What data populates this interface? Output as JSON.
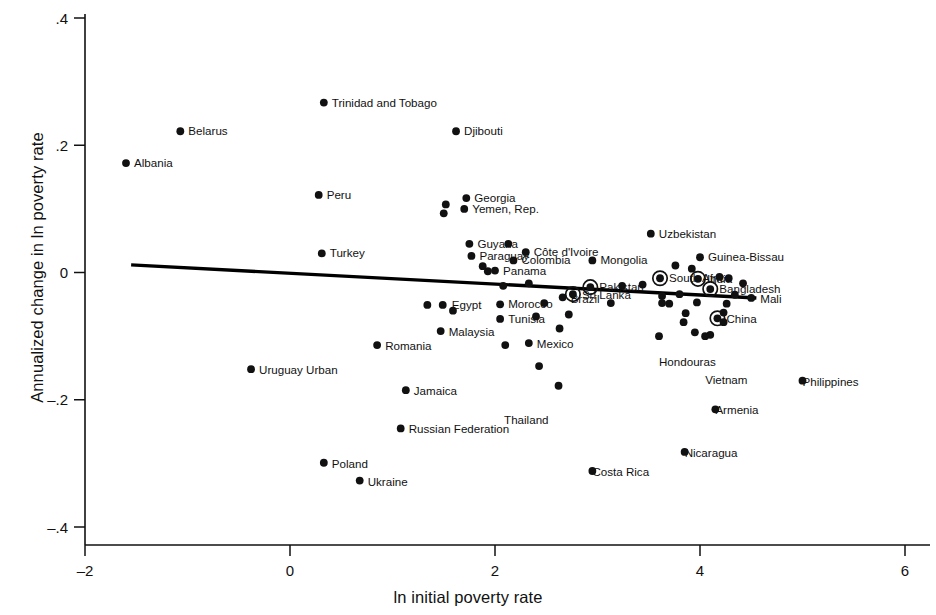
{
  "chart_data": {
    "type": "scatter",
    "title": "",
    "subtitle": "",
    "xlabel": "ln initial poverty rate",
    "ylabel": "Annualized change in ln poverty rate",
    "xlim": [
      -2,
      6
    ],
    "ylim": [
      -0.4,
      0.4
    ],
    "xticks": [
      -2,
      0,
      2,
      4,
      6
    ],
    "xtick_labels": [
      "–2",
      "0",
      "2",
      "4",
      "6"
    ],
    "yticks": [
      0.4,
      0.2,
      0,
      -0.2,
      -0.4
    ],
    "ytick_labels": [
      ".4",
      ".2",
      "0",
      "–.2",
      "–.4"
    ],
    "grid": false,
    "legend": "none",
    "marker_color": "#111111",
    "fitline_color": "#000000",
    "fitline": {
      "x0": -1.55,
      "y0": 0.012,
      "x1": 4.55,
      "y1": -0.04
    },
    "annotations": [
      "Circled markers denote large-population countries"
    ],
    "points": [
      {
        "label": "Albania",
        "x": -1.6,
        "y": 0.172,
        "lx": 8,
        "ly": 4,
        "ring": false
      },
      {
        "label": "Belarus",
        "x": -1.07,
        "y": 0.222,
        "lx": 8,
        "ly": 4,
        "ring": false
      },
      {
        "label": "Trinidad and Tobago",
        "x": 0.33,
        "y": 0.267,
        "lx": 8,
        "ly": 4,
        "ring": false
      },
      {
        "label": "Djibouti",
        "x": 1.62,
        "y": 0.222,
        "lx": 8,
        "ly": 4,
        "ring": false
      },
      {
        "label": "Peru",
        "x": 0.28,
        "y": 0.122,
        "lx": 8,
        "ly": 4,
        "ring": false
      },
      {
        "label": "Georgia",
        "x": 1.72,
        "y": 0.117,
        "lx": 8,
        "ly": 4,
        "ring": false
      },
      {
        "label": "",
        "x": 1.52,
        "y": 0.107,
        "lx": 0,
        "ly": 0,
        "ring": false
      },
      {
        "label": "Yemen, Rep.",
        "x": 1.7,
        "y": 0.1,
        "lx": 8,
        "ly": 4,
        "ring": false
      },
      {
        "label": "",
        "x": 1.5,
        "y": 0.093,
        "lx": 0,
        "ly": 0,
        "ring": false
      },
      {
        "label": "Uzbekistan",
        "x": 3.52,
        "y": 0.061,
        "lx": 8,
        "ly": 4,
        "ring": false
      },
      {
        "label": "Guyana",
        "x": 1.75,
        "y": 0.045,
        "lx": 8,
        "ly": 4,
        "ring": false
      },
      {
        "label": "",
        "x": 2.13,
        "y": 0.045,
        "lx": 0,
        "ly": 0,
        "ring": false
      },
      {
        "label": "Turkey",
        "x": 0.31,
        "y": 0.03,
        "lx": 8,
        "ly": 4,
        "ring": false
      },
      {
        "label": "Paraguay",
        "x": 1.77,
        "y": 0.026,
        "lx": 8,
        "ly": 4,
        "ring": false
      },
      {
        "label": "Côte d'Ivoire",
        "x": 2.3,
        "y": 0.032,
        "lx": 8,
        "ly": 4,
        "ring": false
      },
      {
        "label": "",
        "x": 1.88,
        "y": 0.01,
        "lx": 0,
        "ly": 0,
        "ring": false
      },
      {
        "label": "Panama",
        "x": 2.0,
        "y": 0.003,
        "lx": 8,
        "ly": 4,
        "ring": false
      },
      {
        "label": "",
        "x": 1.93,
        "y": 0.002,
        "lx": 0,
        "ly": 0,
        "ring": false
      },
      {
        "label": "Colombia",
        "x": 2.18,
        "y": 0.019,
        "lx": 8,
        "ly": 4,
        "ring": false
      },
      {
        "label": "Mongolia",
        "x": 2.95,
        "y": 0.019,
        "lx": 8,
        "ly": 4,
        "ring": false
      },
      {
        "label": "Guinea-Bissau",
        "x": 4.0,
        "y": 0.024,
        "lx": 8,
        "ly": 4,
        "ring": false
      },
      {
        "label": "",
        "x": 3.76,
        "y": 0.011,
        "lx": 0,
        "ly": 0,
        "ring": false
      },
      {
        "label": "",
        "x": 3.92,
        "y": 0.006,
        "lx": 0,
        "ly": 0,
        "ring": false
      },
      {
        "label": "South Africa",
        "x": 3.61,
        "y": -0.009,
        "lx": 9,
        "ly": 4,
        "ring": true
      },
      {
        "label": "India",
        "x": 3.98,
        "y": -0.01,
        "lx": 9,
        "ly": 4,
        "ring": true
      },
      {
        "label": "",
        "x": 4.19,
        "y": -0.007,
        "lx": 0,
        "ly": 0,
        "ring": false
      },
      {
        "label": "",
        "x": 4.28,
        "y": -0.009,
        "lx": 0,
        "ly": 0,
        "ring": false
      },
      {
        "label": "",
        "x": 4.42,
        "y": -0.017,
        "lx": 0,
        "ly": 0,
        "ring": false
      },
      {
        "label": "Pakistan",
        "x": 2.93,
        "y": -0.023,
        "lx": 9,
        "ly": 4,
        "ring": true
      },
      {
        "label": "Bangladesh",
        "x": 4.1,
        "y": -0.026,
        "lx": 9,
        "ly": 4,
        "ring": true
      },
      {
        "label": "Sri Lanka",
        "x": 2.76,
        "y": -0.034,
        "lx": 9,
        "ly": 5,
        "ring": true
      },
      {
        "label": "",
        "x": 3.24,
        "y": -0.021,
        "lx": 0,
        "ly": 0,
        "ring": false
      },
      {
        "label": "",
        "x": 3.44,
        "y": -0.019,
        "lx": 0,
        "ly": 0,
        "ring": false
      },
      {
        "label": "",
        "x": 2.08,
        "y": -0.021,
        "lx": 0,
        "ly": 0,
        "ring": false
      },
      {
        "label": "",
        "x": 2.33,
        "y": -0.017,
        "lx": 0,
        "ly": 0,
        "ring": false
      },
      {
        "label": "Brazil",
        "x": 2.66,
        "y": -0.039,
        "lx": 8,
        "ly": 6,
        "ring": false
      },
      {
        "label": "Mali",
        "x": 4.5,
        "y": -0.04,
        "lx": 9,
        "ly": 5,
        "ring": false
      },
      {
        "label": "",
        "x": 4.34,
        "y": -0.035,
        "lx": 0,
        "ly": 0,
        "ring": false
      },
      {
        "label": "",
        "x": 3.63,
        "y": -0.037,
        "lx": 0,
        "ly": 0,
        "ring": false
      },
      {
        "label": "",
        "x": 3.8,
        "y": -0.034,
        "lx": 0,
        "ly": 0,
        "ring": false
      },
      {
        "label": "Egypt",
        "x": 1.49,
        "y": -0.051,
        "lx": 9,
        "ly": 4,
        "ring": false
      },
      {
        "label": "",
        "x": 1.34,
        "y": -0.051,
        "lx": 0,
        "ly": 0,
        "ring": false
      },
      {
        "label": "",
        "x": 1.59,
        "y": -0.06,
        "lx": 0,
        "ly": 0,
        "ring": false
      },
      {
        "label": "Morocco",
        "x": 2.05,
        "y": -0.05,
        "lx": 8,
        "ly": 4,
        "ring": false
      },
      {
        "label": "Tunisia",
        "x": 2.05,
        "y": -0.073,
        "lx": 8,
        "ly": 4,
        "ring": false
      },
      {
        "label": "",
        "x": 2.48,
        "y": -0.048,
        "lx": 0,
        "ly": 0,
        "ring": false
      },
      {
        "label": "",
        "x": 2.4,
        "y": -0.069,
        "lx": 0,
        "ly": 0,
        "ring": false
      },
      {
        "label": "",
        "x": 2.72,
        "y": -0.066,
        "lx": 0,
        "ly": 0,
        "ring": false
      },
      {
        "label": "",
        "x": 3.13,
        "y": -0.048,
        "lx": 0,
        "ly": 0,
        "ring": false
      },
      {
        "label": "",
        "x": 3.63,
        "y": -0.048,
        "lx": 0,
        "ly": 0,
        "ring": false
      },
      {
        "label": "",
        "x": 3.7,
        "y": -0.049,
        "lx": 0,
        "ly": 0,
        "ring": false
      },
      {
        "label": "",
        "x": 3.97,
        "y": -0.047,
        "lx": 0,
        "ly": 0,
        "ring": false
      },
      {
        "label": "",
        "x": 4.26,
        "y": -0.049,
        "lx": 0,
        "ly": 0,
        "ring": false
      },
      {
        "label": "",
        "x": 3.86,
        "y": -0.064,
        "lx": 0,
        "ly": 0,
        "ring": false
      },
      {
        "label": "",
        "x": 4.23,
        "y": -0.063,
        "lx": 0,
        "ly": 0,
        "ring": false
      },
      {
        "label": "",
        "x": 3.84,
        "y": -0.078,
        "lx": 0,
        "ly": 0,
        "ring": false
      },
      {
        "label": "",
        "x": 4.23,
        "y": -0.078,
        "lx": 0,
        "ly": 0,
        "ring": false
      },
      {
        "label": "China",
        "x": 4.17,
        "y": -0.072,
        "lx": 9,
        "ly": 5,
        "ring": true
      },
      {
        "label": "Malaysia",
        "x": 1.47,
        "y": -0.092,
        "lx": 8,
        "ly": 5,
        "ring": false
      },
      {
        "label": "",
        "x": 2.63,
        "y": -0.088,
        "lx": 0,
        "ly": 0,
        "ring": false
      },
      {
        "label": "",
        "x": 3.95,
        "y": -0.094,
        "lx": 0,
        "ly": 0,
        "ring": false
      },
      {
        "label": "",
        "x": 4.1,
        "y": -0.098,
        "lx": 0,
        "ly": 0,
        "ring": false
      },
      {
        "label": "Romania",
        "x": 0.85,
        "y": -0.114,
        "lx": 8,
        "ly": 5,
        "ring": false
      },
      {
        "label": "Mexico",
        "x": 2.33,
        "y": -0.111,
        "lx": 8,
        "ly": 5,
        "ring": false
      },
      {
        "label": "",
        "x": 2.1,
        "y": -0.114,
        "lx": 0,
        "ly": 0,
        "ring": false
      },
      {
        "label": "Hondouras",
        "x": 3.6,
        "y": -0.1,
        "lx": 0,
        "ly": 30,
        "ring": false
      },
      {
        "label": "Vietnam",
        "x": 4.05,
        "y": -0.1,
        "lx": 0,
        "ly": 48,
        "ring": false
      },
      {
        "label": "Uruguay Urban",
        "x": -0.38,
        "y": -0.152,
        "lx": 8,
        "ly": 5,
        "ring": false
      },
      {
        "label": "",
        "x": 2.43,
        "y": -0.147,
        "lx": 0,
        "ly": 0,
        "ring": false
      },
      {
        "label": "Jamaica",
        "x": 1.13,
        "y": -0.185,
        "lx": 8,
        "ly": 5,
        "ring": false
      },
      {
        "label": "Thailand",
        "x": 2.62,
        "y": -0.178,
        "lx": -10,
        "ly": 38,
        "ring": false
      },
      {
        "label": "Philippines",
        "x": 5.0,
        "y": -0.17,
        "lx": 0,
        "ly": 5,
        "ring": false
      },
      {
        "label": "Armenia",
        "x": 4.15,
        "y": -0.215,
        "lx": 0,
        "ly": 5,
        "ring": false
      },
      {
        "label": "Russian Federation",
        "x": 1.08,
        "y": -0.245,
        "lx": 8,
        "ly": 5,
        "ring": false
      },
      {
        "label": "Nicaragua",
        "x": 3.85,
        "y": -0.282,
        "lx": 0,
        "ly": 5,
        "ring": false
      },
      {
        "label": "Costa Rica",
        "x": 2.95,
        "y": -0.312,
        "lx": 0,
        "ly": 5,
        "ring": false
      },
      {
        "label": "Poland",
        "x": 0.33,
        "y": -0.299,
        "lx": 8,
        "ly": 5,
        "ring": false
      },
      {
        "label": "Ukraine",
        "x": 0.68,
        "y": -0.327,
        "lx": 8,
        "ly": 5,
        "ring": false
      }
    ],
    "label_only": [
      "Hondouras",
      "Vietnam",
      "Philippines",
      "Armenia",
      "Nicaragua",
      "Costa Rica",
      "Thailand"
    ]
  }
}
